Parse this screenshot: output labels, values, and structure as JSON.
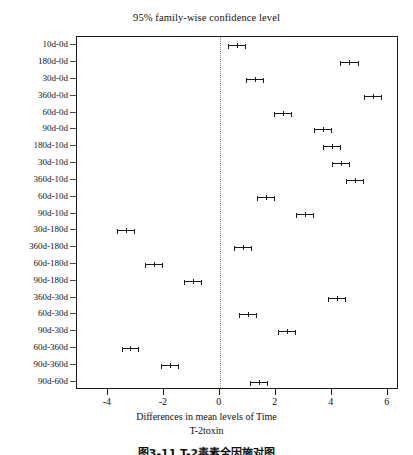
{
  "chart_data": {
    "type": "scatter",
    "title": "95% family-wise confidence level",
    "xlabel_line1": "Differences in mean levels of Time",
    "xlabel_line2": "T-2toxin",
    "ylabel": "",
    "xlim": [
      -5.1,
      6.4
    ],
    "xticks": [
      -4,
      -2,
      0,
      2,
      4,
      6
    ],
    "xtick_labels": [
      "-4",
      "-2",
      "0",
      "2",
      "4",
      "6"
    ],
    "grid": false,
    "legend": null,
    "zero_reference_line": 0,
    "categories": [
      "10d-0d",
      "180d-0d",
      "30d-0d",
      "360d-0d",
      "60d-0d",
      "90d-0d",
      "180d-10d",
      "30d-10d",
      "360d-10d",
      "60d-10d",
      "90d-10d",
      "30d-180d",
      "360d-180d",
      "60d-180d",
      "90d-180d",
      "360d-30d",
      "60d-30d",
      "90d-30d",
      "60d-360d",
      "90d-360d",
      "90d-60d"
    ],
    "points": [
      {
        "label": "10d-0d",
        "estimate": 0.62,
        "lower": 0.3,
        "upper": 0.94
      },
      {
        "label": "180d-0d",
        "estimate": 4.63,
        "lower": 4.3,
        "upper": 4.96
      },
      {
        "label": "30d-0d",
        "estimate": 1.27,
        "lower": 0.95,
        "upper": 1.59
      },
      {
        "label": "360d-0d",
        "estimate": 5.46,
        "lower": 5.14,
        "upper": 5.78
      },
      {
        "label": "60d-0d",
        "estimate": 2.27,
        "lower": 1.95,
        "upper": 2.59
      },
      {
        "label": "90d-0d",
        "estimate": 3.67,
        "lower": 3.35,
        "upper": 3.99
      },
      {
        "label": "180d-10d",
        "estimate": 4.01,
        "lower": 3.69,
        "upper": 4.33
      },
      {
        "label": "30d-10d",
        "estimate": 4.33,
        "lower": 4.01,
        "upper": 4.65
      },
      {
        "label": "360d-10d",
        "estimate": 4.84,
        "lower": 4.52,
        "upper": 5.16
      },
      {
        "label": "60d-10d",
        "estimate": 1.65,
        "lower": 1.33,
        "upper": 1.97
      },
      {
        "label": "90d-10d",
        "estimate": 3.05,
        "lower": 2.73,
        "upper": 3.37
      },
      {
        "label": "30d-180d",
        "estimate": -3.36,
        "lower": -3.68,
        "upper": -3.04
      },
      {
        "label": "360d-180d",
        "estimate": 0.83,
        "lower": 0.51,
        "upper": 1.15
      },
      {
        "label": "60d-180d",
        "estimate": -2.36,
        "lower": -2.68,
        "upper": -2.04
      },
      {
        "label": "90d-180d",
        "estimate": -0.96,
        "lower": -1.28,
        "upper": -0.64
      },
      {
        "label": "360d-30d",
        "estimate": 4.19,
        "lower": 3.87,
        "upper": 4.51
      },
      {
        "label": "60d-30d",
        "estimate": 1.0,
        "lower": 0.68,
        "upper": 1.32
      },
      {
        "label": "90d-30d",
        "estimate": 2.4,
        "lower": 2.08,
        "upper": 2.72
      },
      {
        "label": "60d-360d",
        "estimate": -3.19,
        "lower": -3.51,
        "upper": -2.87
      },
      {
        "label": "90d-360d",
        "estimate": -1.79,
        "lower": -2.11,
        "upper": -1.47
      },
      {
        "label": "90d-60d",
        "estimate": 1.4,
        "lower": 1.08,
        "upper": 1.72
      }
    ]
  },
  "figure": {
    "caption": "图3-11  T-2毒素全因施对图"
  }
}
